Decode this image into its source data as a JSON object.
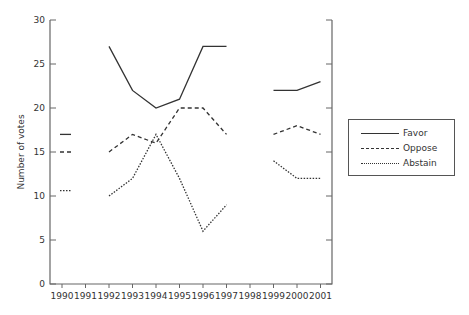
{
  "chart_data": {
    "type": "line",
    "title": "",
    "xlabel": "",
    "ylabel": "Number of votes",
    "x": [
      1990,
      1991,
      1992,
      1993,
      1994,
      1995,
      1996,
      1997,
      1998,
      1999,
      2000,
      2001
    ],
    "ylim": [
      0,
      30
    ],
    "yticks": [
      0,
      5,
      10,
      15,
      20,
      25,
      30
    ],
    "grid": false,
    "legend_position": "right",
    "series": [
      {
        "name": "Favor",
        "style": "solid",
        "values": [
          17,
          null,
          27,
          22,
          20,
          21,
          27,
          27,
          null,
          22,
          22,
          23
        ]
      },
      {
        "name": "Oppose",
        "style": "dashed",
        "values": [
          15,
          null,
          15,
          17,
          16,
          20,
          20,
          17,
          null,
          17,
          18,
          17
        ]
      },
      {
        "name": "Abstain",
        "style": "dotted",
        "values": [
          10.6,
          null,
          10,
          12,
          17,
          12,
          6,
          9,
          null,
          14,
          12,
          12
        ]
      }
    ]
  },
  "legend": {
    "items": [
      {
        "label": "Favor",
        "style": "solid"
      },
      {
        "label": "Oppose",
        "style": "dashed"
      },
      {
        "label": "Abstain",
        "style": "dotted"
      }
    ]
  },
  "colors": {
    "line": "#333333",
    "axis": "#666666"
  }
}
